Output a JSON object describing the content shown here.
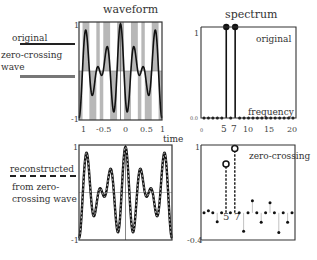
{
  "chart_data": [
    {
      "type": "line",
      "panel": "top-left",
      "title": "waveform",
      "xlabel": "time",
      "ylabel": "",
      "xlim": [
        -1,
        1
      ],
      "ylim": [
        -1,
        1
      ],
      "x_tick_labels": [
        "1",
        "-0.5",
        "0",
        "0.5",
        "1"
      ],
      "y_tick_labels": [
        "1",
        "-1"
      ],
      "series": [
        {
          "name": "original",
          "expression": "0.5*cos(5*pi*t) + 0.5*cos(7*pi*t)",
          "style": "solid black"
        },
        {
          "name": "zero-crossing wave",
          "expression": "sign(original)",
          "style": "gray shaded bands"
        }
      ]
    },
    {
      "type": "bar",
      "panel": "top-right",
      "title": "spectrum",
      "annotation": "original",
      "xlabel": "frequency",
      "x_tick_labels": [
        "0",
        "5",
        "7",
        "10",
        "15",
        "20"
      ],
      "y_tick_labels": [
        "1",
        "0.0"
      ],
      "xlim": [
        0,
        20
      ],
      "ylim": [
        0,
        1
      ],
      "categories": [
        0,
        1,
        2,
        3,
        4,
        5,
        6,
        7,
        8,
        9,
        10,
        11,
        12,
        13,
        14,
        15,
        16,
        17,
        18,
        19,
        20
      ],
      "values": [
        0,
        0,
        0,
        0,
        0,
        1,
        0,
        1,
        0,
        0,
        0,
        0,
        0,
        0,
        0,
        0,
        0,
        0,
        0,
        0,
        0
      ]
    },
    {
      "type": "line",
      "panel": "bottom-left",
      "title": "",
      "xlim": [
        -1,
        1
      ],
      "ylim": [
        -1,
        1
      ],
      "y_tick_labels": [
        "1",
        "-1"
      ],
      "series": [
        {
          "name": "original",
          "style": "solid black"
        },
        {
          "name": "reconstructed from zero-crossing wave",
          "style": "dashed, overlaid"
        }
      ]
    },
    {
      "type": "bar",
      "panel": "bottom-right",
      "annotation": "zero-crossing",
      "x_tick_labels": [
        "5",
        "7"
      ],
      "y_tick_labels": [
        "1",
        "-0.4"
      ],
      "xlim": [
        0,
        20
      ],
      "ylim": [
        -0.4,
        1
      ],
      "categories": [
        0,
        1,
        2,
        3,
        4,
        5,
        6,
        7,
        8,
        9,
        10,
        11,
        12,
        13,
        14,
        15,
        16,
        17,
        18,
        19,
        20
      ],
      "values": [
        0,
        0.03,
        0,
        -0.13,
        0,
        0.72,
        0,
        0.95,
        0,
        -0.27,
        0,
        0.18,
        0,
        -0.14,
        0,
        0.15,
        0,
        -0.29,
        0,
        -0.14,
        0
      ]
    }
  ],
  "legend": {
    "original": "original",
    "zero_crossing_l1": "zero-crossing",
    "zero_crossing_l2": "wave",
    "reconstructed": "reconstructed",
    "from_zc_l1": "from zero-",
    "from_zc_l2": "crossing wave"
  },
  "panels": {
    "tl": {
      "title": "waveform",
      "y_top": "1",
      "y_bot": "-1",
      "xticks": [
        "1",
        "-0.5",
        "0",
        "0.5",
        "1"
      ],
      "xlabel": "time"
    },
    "tr": {
      "title": "spectrum",
      "y_top": "1",
      "y_bot": "0.0",
      "annotation": "original",
      "xlabel": "frequency",
      "xticks": [
        "0",
        "5",
        "7",
        "10",
        "15",
        "20"
      ]
    },
    "bl": {
      "y_top": "1",
      "y_bot": "-1"
    },
    "br": {
      "y_top": "1",
      "y_bot": "-0.4",
      "annotation": "zero-crossing",
      "mark5": "5",
      "mark7": "7"
    }
  },
  "colors": {
    "line": "#111111",
    "shade": "#b8b8b8",
    "frame": "#333333"
  }
}
